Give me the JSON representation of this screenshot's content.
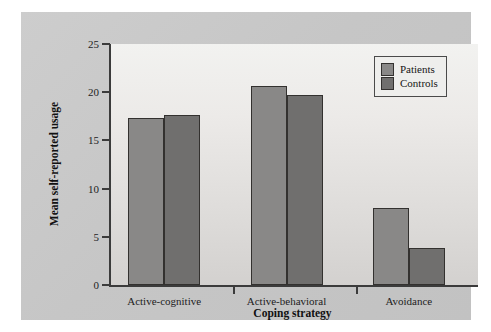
{
  "chart_data": {
    "type": "bar",
    "title": "",
    "xlabel": "Coping strategy",
    "ylabel": "Mean self-reported usage",
    "categories": [
      "Active-cognitive",
      "Active-behavioral",
      "Avoidance"
    ],
    "series": [
      {
        "name": "Patients",
        "color": "#898887",
        "values": [
          17.3,
          20.6,
          8.0
        ]
      },
      {
        "name": "Controls",
        "color": "#706f6e",
        "values": [
          17.6,
          19.7,
          3.8
        ]
      }
    ],
    "ylim": [
      0,
      25
    ],
    "yticks": [
      0,
      5,
      10,
      15,
      20,
      25
    ],
    "ytick_labels": [
      "0",
      "5",
      "10",
      "15",
      "20",
      "25"
    ],
    "grid": false,
    "legend_position": "top-right",
    "legend_entries": [
      "Patients",
      "Controls"
    ]
  },
  "figure": {
    "background_color": "#c9c9c9",
    "plot_background_color": "#eceae8",
    "axis_color": "#3b3b3b"
  }
}
